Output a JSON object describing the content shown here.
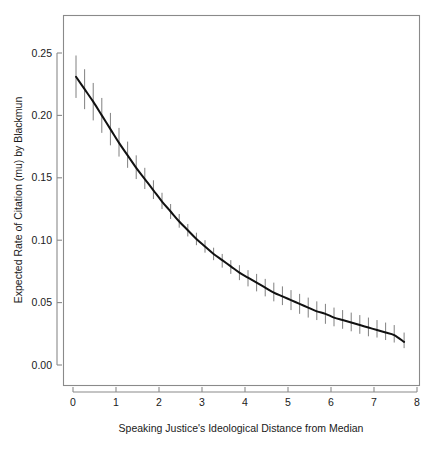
{
  "chart_data": {
    "type": "line",
    "title": "",
    "subtitle": "",
    "xlabel": "Speaking Justice's Ideological Distance from Median",
    "ylabel": "Expected Rate of Citation (mu) by Blackmun",
    "xlim": [
      -0.18,
      8.1
    ],
    "ylim": [
      -0.012,
      0.272
    ],
    "xticks": [
      0,
      1,
      2,
      3,
      4,
      5,
      6,
      7,
      8
    ],
    "xtick_labels": [
      "0",
      "1",
      "2",
      "3",
      "4",
      "5",
      "6",
      "7",
      "8"
    ],
    "yticks": [
      0.0,
      0.05,
      0.1,
      0.15,
      0.2,
      0.25
    ],
    "ytick_labels": [
      "0.00",
      "0.05",
      "0.10",
      "0.15",
      "0.20",
      "0.25"
    ],
    "grid": false,
    "legend": null,
    "line_color": "#111111",
    "errorbar_color": "#808080",
    "frame_color": "#8a8a8a",
    "background": "#ffffff",
    "series": [
      {
        "name": "Expected rate of citation",
        "x": [
          0.07,
          0.27,
          0.47,
          0.67,
          0.87,
          1.07,
          1.27,
          1.47,
          1.67,
          1.87,
          2.07,
          2.27,
          2.47,
          2.67,
          2.87,
          3.07,
          3.27,
          3.47,
          3.67,
          3.87,
          4.07,
          4.27,
          4.47,
          4.67,
          4.87,
          5.07,
          5.27,
          5.47,
          5.67,
          5.87,
          6.07,
          6.27,
          6.47,
          6.67,
          6.87,
          7.07,
          7.27,
          7.47,
          7.7
        ],
        "y": [
          0.231,
          0.221,
          0.211,
          0.2,
          0.189,
          0.178,
          0.168,
          0.158,
          0.149,
          0.14,
          0.131,
          0.123,
          0.115,
          0.108,
          0.101,
          0.095,
          0.089,
          0.084,
          0.079,
          0.074,
          0.07,
          0.066,
          0.062,
          0.058,
          0.055,
          0.052,
          0.049,
          0.046,
          0.043,
          0.041,
          0.038,
          0.036,
          0.034,
          0.032,
          0.03,
          0.028,
          0.026,
          0.024,
          0.0185
        ],
        "y_lower": [
          0.214,
          0.205,
          0.196,
          0.186,
          0.176,
          0.167,
          0.158,
          0.149,
          0.141,
          0.133,
          0.125,
          0.117,
          0.11,
          0.103,
          0.096,
          0.09,
          0.084,
          0.078,
          0.073,
          0.068,
          0.063,
          0.059,
          0.055,
          0.051,
          0.048,
          0.044,
          0.041,
          0.038,
          0.036,
          0.033,
          0.031,
          0.029,
          0.027,
          0.025,
          0.023,
          0.022,
          0.02,
          0.018,
          0.0135
        ],
        "y_upper": [
          0.248,
          0.237,
          0.226,
          0.214,
          0.202,
          0.19,
          0.179,
          0.168,
          0.158,
          0.148,
          0.138,
          0.129,
          0.121,
          0.113,
          0.106,
          0.1,
          0.094,
          0.089,
          0.084,
          0.08,
          0.076,
          0.073,
          0.069,
          0.066,
          0.063,
          0.06,
          0.057,
          0.054,
          0.051,
          0.049,
          0.046,
          0.044,
          0.042,
          0.04,
          0.038,
          0.036,
          0.034,
          0.032,
          0.026
        ]
      }
    ]
  }
}
